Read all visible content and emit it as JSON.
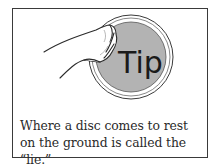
{
  "tip": {
    "label": "Tip",
    "caption": "Where a disc comes to rest on the ground is called the “lie.”",
    "disc_color": "#b3b3b3",
    "border_color": "#3a3a3a"
  }
}
